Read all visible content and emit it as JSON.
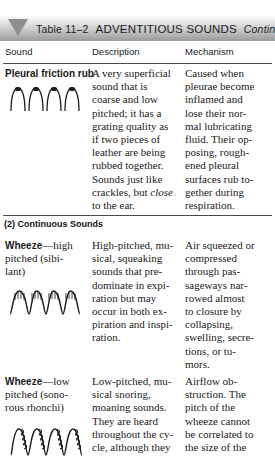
{
  "banner": {
    "icon": "triangle-down-icon",
    "table_label": "Table 11–2",
    "title": "ADVENTITIOUS SOUNDS",
    "continued": "Continued"
  },
  "columns": {
    "sound": "Sound",
    "description": "Description",
    "mechanism": "Mechanism"
  },
  "rows": [
    {
      "id": "pleural-friction-rub",
      "term": "Pleural friction rub",
      "term_suffix": "",
      "sound_lines": [],
      "waveform": "arches",
      "description_lines": [
        "A very superficial",
        "sound that is",
        "coarse and low",
        "pitched; it has a",
        "grating quality as",
        "if two pieces of",
        "leather are being",
        "rubbed together.",
        "Sounds just like",
        "crackles, but ",
        "to the ear."
      ],
      "description_italic_word": "close",
      "mechanism_lines": [
        "Caused when",
        "pleurae become",
        "inflamed and",
        "lose their nor-",
        "mal lubricating",
        "fluid. Their op-",
        "posing, rough-",
        "ened pleural",
        "surfaces rub to-",
        "gether during",
        "respiration."
      ]
    },
    {
      "id": "wheeze-high-pitched",
      "term": "Wheeze",
      "term_suffix": "—high",
      "sound_lines": [
        "pitched (sibi-",
        "lant)"
      ],
      "waveform": "sine-hatched",
      "description_lines": [
        "High-pitched, mu-",
        "sical, squeaking",
        "sounds that pre-",
        "dominate in expi-",
        "ration but may",
        "occur in both ex-",
        "piration and inspi-",
        "ration."
      ],
      "mechanism_lines": [
        "Air squeezed or",
        "compressed",
        "through pas-",
        "sageways nar-",
        "rowed almost",
        "to closure by",
        "collapsing,",
        "swelling, secre-",
        "tions, or tu-",
        "mors."
      ]
    },
    {
      "id": "wheeze-low-pitched",
      "term": "Wheeze",
      "term_suffix": "—low",
      "sound_lines": [
        "pitched (sono-",
        "rous rhonchi)"
      ],
      "waveform": "curly",
      "description_lines": [
        "Low-pitched, mu-",
        "sical snoring,",
        "moaning sounds.",
        "They are heard",
        "throughout the cy-",
        "cle, although they"
      ],
      "mechanism_lines": [
        "Airflow ob-",
        "struction. The",
        "pitch of the",
        "wheeze cannot",
        "be correlated to",
        "the size of the"
      ]
    }
  ],
  "sections": [
    {
      "id": "continuous-sounds",
      "label": "(2) Continuous Sounds"
    }
  ]
}
